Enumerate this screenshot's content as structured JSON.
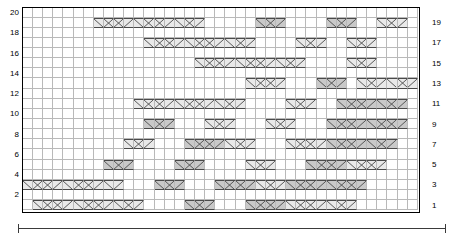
{
  "chart_data": {
    "type": "heatmap",
    "title": "",
    "subtitle": "",
    "xlabel": "",
    "ylabel": "",
    "grid": true,
    "legend_position": "none",
    "columns": 39,
    "rows": 20,
    "x": [
      1,
      2,
      3,
      4,
      5,
      6,
      7,
      8,
      9,
      10,
      11,
      12,
      13,
      14,
      15,
      16,
      17,
      18,
      19,
      20,
      21,
      22,
      23,
      24,
      25,
      26,
      27,
      28,
      29,
      30,
      31,
      32,
      33,
      34,
      35,
      36,
      37,
      38,
      39
    ],
    "row_labels_left": [
      "20",
      "18",
      "16",
      "14",
      "12",
      "10",
      "8",
      "6",
      "4",
      "2"
    ],
    "row_labels_right": [
      "19",
      "17",
      "15",
      "13",
      "11",
      "9",
      "7",
      "5",
      "3",
      "1"
    ],
    "symbol_legend": [
      {
        "key": "blank",
        "label": "plain cell",
        "fill": "#ffffff"
      },
      {
        "key": "light",
        "label": "cable cross light",
        "fill": "#e9e9e9"
      },
      {
        "key": "dark",
        "label": "cable cross dark",
        "fill": "#c9c9c9"
      }
    ],
    "colors": {
      "grid_line": "#b9b9b9",
      "frame": "#000000",
      "shade_light": "#e9e9e9",
      "shade_dark": "#c9c9c9",
      "symbol_line": "#4a4a4a",
      "bracket": "#3a3a3a"
    },
    "cells": [
      {
        "row": 20,
        "runs": []
      },
      {
        "row": 19,
        "runs": [
          {
            "start": 8,
            "len": 4,
            "shade": "light",
            "sym": "cross"
          },
          {
            "start": 12,
            "len": 4,
            "shade": "light",
            "sym": "cross"
          },
          {
            "start": 16,
            "len": 3,
            "shade": "light",
            "sym": "cross"
          },
          {
            "start": 24,
            "len": 3,
            "shade": "dark",
            "sym": "cross"
          },
          {
            "start": 31,
            "len": 3,
            "shade": "dark",
            "sym": "cross"
          },
          {
            "start": 36,
            "len": 3,
            "shade": "light",
            "sym": "cross"
          }
        ]
      },
      {
        "row": 18,
        "runs": []
      },
      {
        "row": 17,
        "runs": [
          {
            "start": 13,
            "len": 4,
            "shade": "light",
            "sym": "cross"
          },
          {
            "start": 17,
            "len": 4,
            "shade": "light",
            "sym": "cross"
          },
          {
            "start": 21,
            "len": 3,
            "shade": "light",
            "sym": "cross"
          },
          {
            "start": 28,
            "len": 3,
            "shade": "light",
            "sym": "cross"
          },
          {
            "start": 33,
            "len": 3,
            "shade": "light",
            "sym": "cross"
          }
        ]
      },
      {
        "row": 16,
        "runs": []
      },
      {
        "row": 15,
        "runs": [
          {
            "start": 18,
            "len": 4,
            "shade": "light",
            "sym": "cross"
          },
          {
            "start": 22,
            "len": 4,
            "shade": "light",
            "sym": "cross"
          },
          {
            "start": 26,
            "len": 3,
            "shade": "light",
            "sym": "cross"
          },
          {
            "start": 33,
            "len": 3,
            "shade": "light",
            "sym": "cross"
          }
        ]
      },
      {
        "row": 14,
        "runs": []
      },
      {
        "row": 13,
        "runs": [
          {
            "start": 23,
            "len": 4,
            "shade": "light",
            "sym": "cross"
          },
          {
            "start": 30,
            "len": 3,
            "shade": "dark",
            "sym": "cross"
          },
          {
            "start": 34,
            "len": 3,
            "shade": "light",
            "sym": "cross"
          },
          {
            "start": 37,
            "len": 3,
            "shade": "light",
            "sym": "cross"
          }
        ]
      },
      {
        "row": 12,
        "runs": []
      },
      {
        "row": 11,
        "runs": [
          {
            "start": 12,
            "len": 4,
            "shade": "light",
            "sym": "cross"
          },
          {
            "start": 16,
            "len": 4,
            "shade": "light",
            "sym": "cross"
          },
          {
            "start": 20,
            "len": 3,
            "shade": "light",
            "sym": "cross"
          },
          {
            "start": 27,
            "len": 3,
            "shade": "light",
            "sym": "cross"
          },
          {
            "start": 32,
            "len": 4,
            "shade": "dark",
            "sym": "cross"
          },
          {
            "start": 36,
            "len": 3,
            "shade": "dark",
            "sym": "cross"
          }
        ]
      },
      {
        "row": 10,
        "runs": []
      },
      {
        "row": 9,
        "runs": [
          {
            "start": 13,
            "len": 3,
            "shade": "dark",
            "sym": "cross"
          },
          {
            "start": 19,
            "len": 3,
            "shade": "light",
            "sym": "cross"
          },
          {
            "start": 25,
            "len": 3,
            "shade": "light",
            "sym": "cross"
          },
          {
            "start": 31,
            "len": 4,
            "shade": "dark",
            "sym": "cross"
          },
          {
            "start": 35,
            "len": 4,
            "shade": "dark",
            "sym": "cross"
          }
        ]
      },
      {
        "row": 8,
        "runs": []
      },
      {
        "row": 7,
        "runs": [
          {
            "start": 11,
            "len": 3,
            "shade": "light",
            "sym": "cross"
          },
          {
            "start": 17,
            "len": 4,
            "shade": "dark",
            "sym": "cross"
          },
          {
            "start": 21,
            "len": 3,
            "shade": "light",
            "sym": "cross"
          },
          {
            "start": 27,
            "len": 4,
            "shade": "light",
            "sym": "cross"
          },
          {
            "start": 31,
            "len": 4,
            "shade": "dark",
            "sym": "cross"
          },
          {
            "start": 35,
            "len": 3,
            "shade": "dark",
            "sym": "cross"
          }
        ]
      },
      {
        "row": 6,
        "runs": []
      },
      {
        "row": 5,
        "runs": [
          {
            "start": 9,
            "len": 3,
            "shade": "dark",
            "sym": "cross"
          },
          {
            "start": 16,
            "len": 3,
            "shade": "dark",
            "sym": "cross"
          },
          {
            "start": 23,
            "len": 3,
            "shade": "light",
            "sym": "cross"
          },
          {
            "start": 29,
            "len": 4,
            "shade": "dark",
            "sym": "cross"
          },
          {
            "start": 33,
            "len": 4,
            "shade": "light",
            "sym": "cross"
          }
        ]
      },
      {
        "row": 4,
        "runs": []
      },
      {
        "row": 3,
        "runs": [
          {
            "start": 1,
            "len": 4,
            "shade": "light",
            "sym": "cross"
          },
          {
            "start": 5,
            "len": 4,
            "shade": "light",
            "sym": "cross"
          },
          {
            "start": 9,
            "len": 2,
            "shade": "light",
            "sym": "cross"
          },
          {
            "start": 14,
            "len": 3,
            "shade": "dark",
            "sym": "cross"
          },
          {
            "start": 20,
            "len": 4,
            "shade": "dark",
            "sym": "cross"
          },
          {
            "start": 24,
            "len": 3,
            "shade": "light",
            "sym": "cross"
          },
          {
            "start": 27,
            "len": 4,
            "shade": "dark",
            "sym": "cross"
          },
          {
            "start": 31,
            "len": 4,
            "shade": "dark",
            "sym": "cross"
          }
        ]
      },
      {
        "row": 2,
        "runs": []
      },
      {
        "row": 1,
        "runs": [
          {
            "start": 2,
            "len": 4,
            "shade": "light",
            "sym": "cross"
          },
          {
            "start": 6,
            "len": 4,
            "shade": "light",
            "sym": "cross"
          },
          {
            "start": 10,
            "len": 3,
            "shade": "light",
            "sym": "cross"
          },
          {
            "start": 17,
            "len": 3,
            "shade": "dark",
            "sym": "cross"
          },
          {
            "start": 23,
            "len": 4,
            "shade": "dark",
            "sym": "cross"
          },
          {
            "start": 27,
            "len": 4,
            "shade": "light",
            "sym": "cross"
          },
          {
            "start": 31,
            "len": 3,
            "shade": "light",
            "sym": "cross"
          }
        ]
      }
    ]
  },
  "bracket": {
    "label": ""
  }
}
